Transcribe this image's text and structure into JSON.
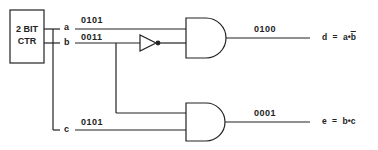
{
  "counter": {
    "line1": "2 BIT",
    "line2": "CTR"
  },
  "signals": {
    "a": {
      "name": "a",
      "bits": "0101"
    },
    "b": {
      "name": "b",
      "bits": "0011"
    },
    "c": {
      "name": "c",
      "bits": "0101"
    }
  },
  "outputs": {
    "d": {
      "bits": "0100",
      "eq_lhs": "d",
      "eq_sign": "=",
      "eq_term1": "a",
      "eq_dot": "•",
      "eq_term2": "b"
    },
    "e": {
      "bits": "0001",
      "eq_lhs": "e",
      "eq_sign": "=",
      "eq_term1": "b",
      "eq_dot": "•",
      "eq_term2": "c"
    }
  },
  "colors": {
    "stroke": "#222222",
    "background": "#ffffff"
  }
}
